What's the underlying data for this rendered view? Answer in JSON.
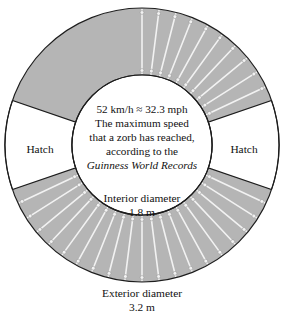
{
  "figure": {
    "ring_fill_color": "#b5b5b5",
    "spoke_color": "#f2f2f2",
    "outline_color": "#1d1d1d",
    "background_color": "#ffffff",
    "interior_fill_color": "#ffffff"
  },
  "center_note": {
    "lines": [
      "52 km/h ≈ 32.3 mph",
      "The maximum speed",
      "that a zorb has reached,",
      "according to the"
    ],
    "italic_line": "Guinness World Records"
  },
  "hatches": {
    "left_label": "Hatch",
    "right_label": "Hatch"
  },
  "dimensions": {
    "interior_label": "Interior diameter",
    "interior_value": "1.8 m",
    "exterior_label": "Exterior diameter",
    "exterior_value": "3.2 m"
  },
  "chart_data": {
    "type": "diagram",
    "geometry": {
      "center_x": 142,
      "center_y": 145,
      "outer_radius": 137,
      "inner_radius": 70,
      "spoke_count": 40,
      "spoke_step_degrees": 7.2,
      "hatch_half_angle_degrees": 19,
      "grommet_radius": 1.9
    },
    "annotations": [
      "52 km/h ≈ 32.3 mph",
      "The maximum speed",
      "that a zorb has reached,",
      "according to the",
      "Guinness World Records",
      "Hatch",
      "Hatch",
      "Interior diameter",
      "1.8 m",
      "Exterior diameter",
      "3.2 m"
    ],
    "values": {
      "max_speed_kmh": 52,
      "max_speed_mph": 32.3,
      "interior_diameter_m": 1.8,
      "exterior_diameter_m": 3.2
    }
  }
}
